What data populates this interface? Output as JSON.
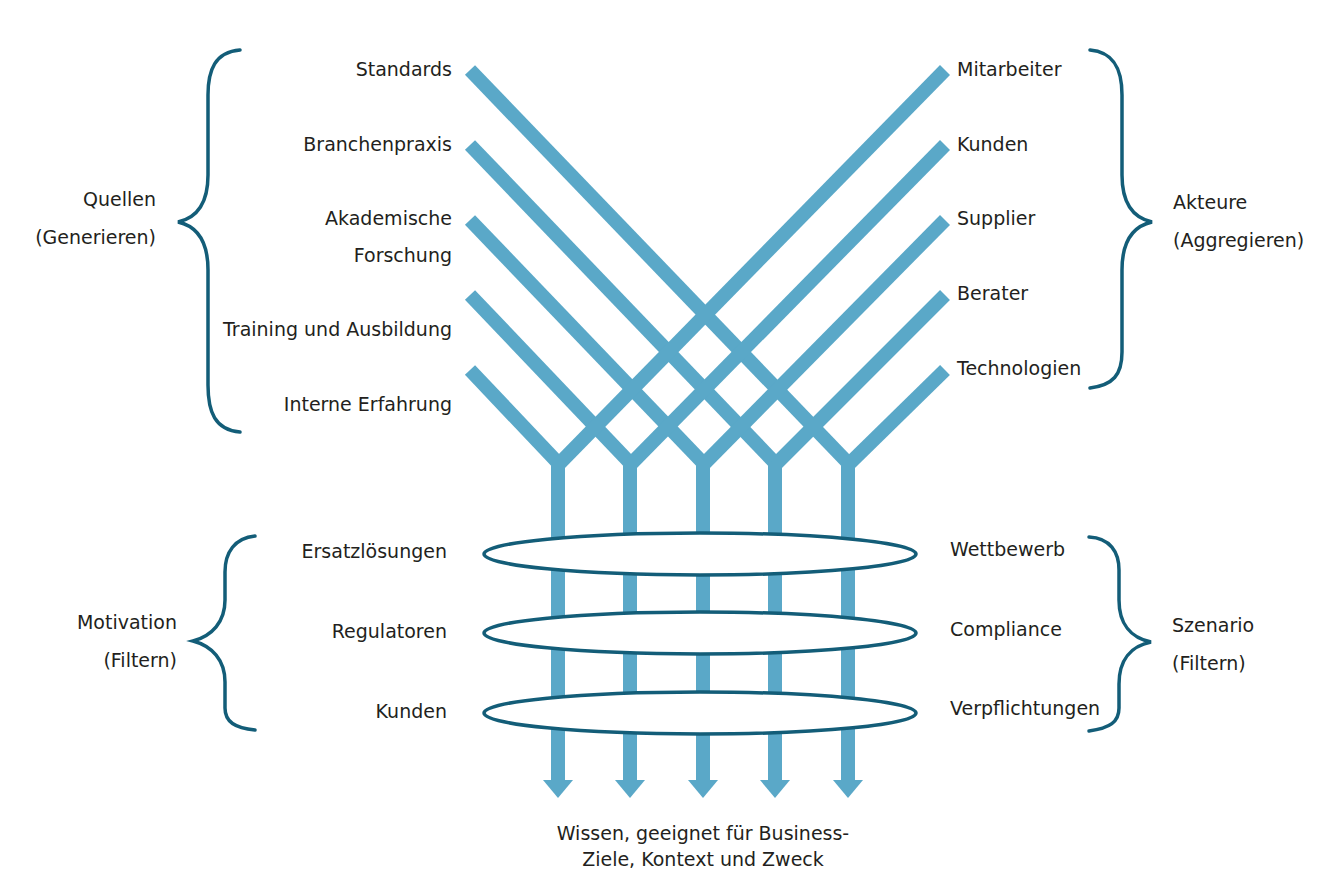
{
  "colors": {
    "flow_line": "#5aa8c8",
    "brace": "#135d78",
    "ellipse_stroke": "#135d78",
    "text": "#231f20",
    "background": "#ffffff"
  },
  "sources": {
    "group_title": "Quellen",
    "group_subtitle": "(Generieren)",
    "items": [
      {
        "label": "Standards"
      },
      {
        "label": "Branchenpraxis"
      },
      {
        "label": "Akademische",
        "label2": "Forschung"
      },
      {
        "label": "Training und Ausbildung"
      },
      {
        "label": "Interne Erfahrung"
      }
    ]
  },
  "actors": {
    "group_title": "Akteure",
    "group_subtitle": "(Aggregieren)",
    "items": [
      {
        "label": "Mitarbeiter"
      },
      {
        "label": "Kunden"
      },
      {
        "label": "Supplier"
      },
      {
        "label": "Berater"
      },
      {
        "label": "Technologien"
      }
    ]
  },
  "motivation": {
    "group_title": "Motivation",
    "group_subtitle": "(Filtern)",
    "items": [
      {
        "label": "Ersatzlösungen"
      },
      {
        "label": "Regulatoren"
      },
      {
        "label": "Kunden"
      }
    ]
  },
  "scenario": {
    "group_title": "Szenario",
    "group_subtitle": "(Filtern)",
    "items": [
      {
        "label": "Wettbewerb"
      },
      {
        "label": "Compliance"
      },
      {
        "label": "Verpflichtungen"
      }
    ]
  },
  "output": {
    "line1": "Wissen, geeignet für Business-",
    "line2": "Ziele, Kontext und Zweck"
  },
  "icons": {
    "flow_arrow": "arrow-down-icon",
    "brace": "curly-brace-icon",
    "filter": "ellipse-filter-icon"
  }
}
